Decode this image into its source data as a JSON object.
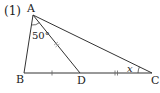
{
  "problem": {
    "number_label": "(1)"
  },
  "points": {
    "A": "A",
    "B": "B",
    "C": "C",
    "D": "D"
  },
  "angles": {
    "BAD": "50°",
    "ACB": "x"
  },
  "markings": {
    "BD": "single tick",
    "DC": "double tick",
    "AD": "double tick"
  },
  "colors": {
    "line": "#333333",
    "background": "#ffffff"
  }
}
